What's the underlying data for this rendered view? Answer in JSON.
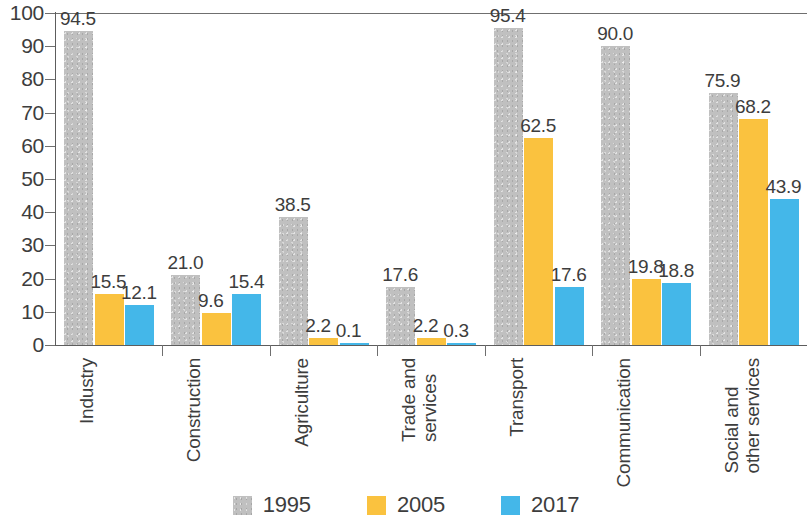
{
  "chart_data": {
    "type": "bar",
    "title": "",
    "subtitle": "",
    "xlabel": "",
    "ylabel": "",
    "ylim": [
      0,
      100
    ],
    "ytick_step": 10,
    "yticks": [
      "0",
      "10",
      "20",
      "30",
      "40",
      "50",
      "60",
      "70",
      "80",
      "90",
      "100"
    ],
    "grid": false,
    "legend_position": "bottom-center",
    "categories": [
      "Industry",
      "Construction",
      "Agriculture",
      "Trade and\nservices",
      "Transport",
      "Communication",
      "Social and\nother services"
    ],
    "series": [
      {
        "name": "1995",
        "color": "#c0c0c0",
        "values": [
          94.5,
          21.0,
          38.5,
          17.6,
          95.4,
          90.0,
          75.9
        ],
        "labels": [
          "94.5",
          "21.0",
          "38.5",
          "17.6",
          "95.4",
          "90.0",
          "75.9"
        ]
      },
      {
        "name": "2005",
        "color": "#fac23f",
        "values": [
          15.5,
          9.6,
          2.2,
          2.2,
          62.5,
          19.8,
          68.2
        ],
        "labels": [
          "15.5",
          "9.6",
          "2.2",
          "2.2",
          "62.5",
          "19.8",
          "68.2"
        ]
      },
      {
        "name": "2017",
        "color": "#44b7e9",
        "values": [
          12.1,
          15.4,
          0.1,
          0.3,
          17.6,
          18.8,
          43.9
        ],
        "labels": [
          "12.1",
          "15.4",
          "0.1",
          "0.3",
          "17.6",
          "18.8",
          "43.9"
        ]
      }
    ]
  },
  "legend": {
    "items": [
      {
        "label": "1995",
        "color": "#c0c0c0"
      },
      {
        "label": "2005",
        "color": "#fac23f"
      },
      {
        "label": "2017",
        "color": "#44b7e9"
      }
    ]
  }
}
